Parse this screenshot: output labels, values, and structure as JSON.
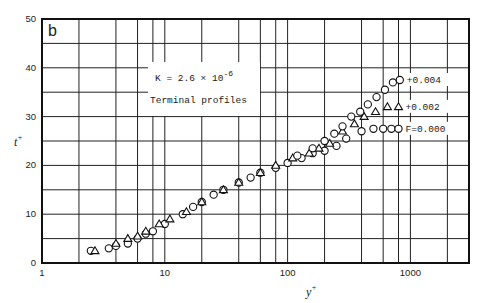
{
  "chart_data": {
    "type": "scatter",
    "panel_label": "b",
    "title": "",
    "xlabel": "y",
    "xlabel_sup": "+",
    "ylabel": "t",
    "ylabel_sup": "+",
    "xscale": "log",
    "xlim": [
      1,
      3000
    ],
    "ylim": [
      0,
      50
    ],
    "grid": true,
    "x_ticks": [
      {
        "value": 1,
        "label": "1"
      },
      {
        "value": 10,
        "label": "10"
      },
      {
        "value": 100,
        "label": "100"
      },
      {
        "value": 1000,
        "label": "1000"
      }
    ],
    "x_gridlines": [
      2,
      4,
      6,
      8,
      10,
      20,
      40,
      60,
      80,
      100,
      200,
      400,
      600,
      800,
      1000,
      2000
    ],
    "y_ticks": [
      {
        "value": 0,
        "label": "0"
      },
      {
        "value": 10,
        "label": "10"
      },
      {
        "value": 20,
        "label": "20"
      },
      {
        "value": 30,
        "label": "30"
      },
      {
        "value": 40,
        "label": "40"
      },
      {
        "value": 50,
        "label": "50"
      }
    ],
    "y_gridlines": [
      5,
      10,
      15,
      20,
      25,
      30,
      35,
      40,
      45
    ],
    "annotations": [
      {
        "text": "K = 2.6 × 10",
        "sup": "-6"
      },
      {
        "text": "Terminal profiles"
      }
    ],
    "series": [
      {
        "name": "F=0.000",
        "marker": "circle",
        "label": "F=0.000",
        "x": [
          2.5,
          3.5,
          4,
          5,
          6,
          7,
          8,
          10,
          14,
          17,
          20,
          25,
          30,
          40,
          50,
          60,
          80,
          100,
          130,
          160,
          200,
          250,
          300,
          400,
          500,
          600,
          700,
          800
        ],
        "y": [
          2.5,
          3,
          3.5,
          4,
          5,
          6,
          6.5,
          8,
          10,
          11.5,
          12.5,
          14,
          15,
          16.5,
          17.5,
          18.5,
          19.5,
          20.5,
          21.5,
          22.5,
          23,
          24,
          25.5,
          27,
          27.5,
          27.5,
          27.5,
          27.5
        ]
      },
      {
        "name": "+0.002",
        "marker": "triangle",
        "label": "+0.002",
        "x": [
          2.7,
          4,
          5,
          6,
          7,
          9,
          11,
          15,
          20,
          30,
          40,
          60,
          80,
          110,
          150,
          180,
          220,
          280,
          350,
          420,
          520,
          650,
          800
        ],
        "y": [
          2.5,
          4,
          5,
          5.5,
          6.5,
          8,
          9,
          10.5,
          12.5,
          15,
          16.5,
          18.5,
          20,
          21.5,
          22.5,
          23.5,
          24.5,
          27,
          28.5,
          30,
          31,
          32,
          32
        ]
      },
      {
        "name": "+0.004",
        "marker": "circle",
        "label": "+0.004",
        "x": [
          120,
          160,
          200,
          240,
          280,
          330,
          390,
          450,
          530,
          620,
          720,
          820
        ],
        "y": [
          22,
          23.5,
          25,
          26.5,
          28,
          30,
          31,
          32.5,
          34,
          35.5,
          37,
          37.5
        ]
      }
    ]
  }
}
